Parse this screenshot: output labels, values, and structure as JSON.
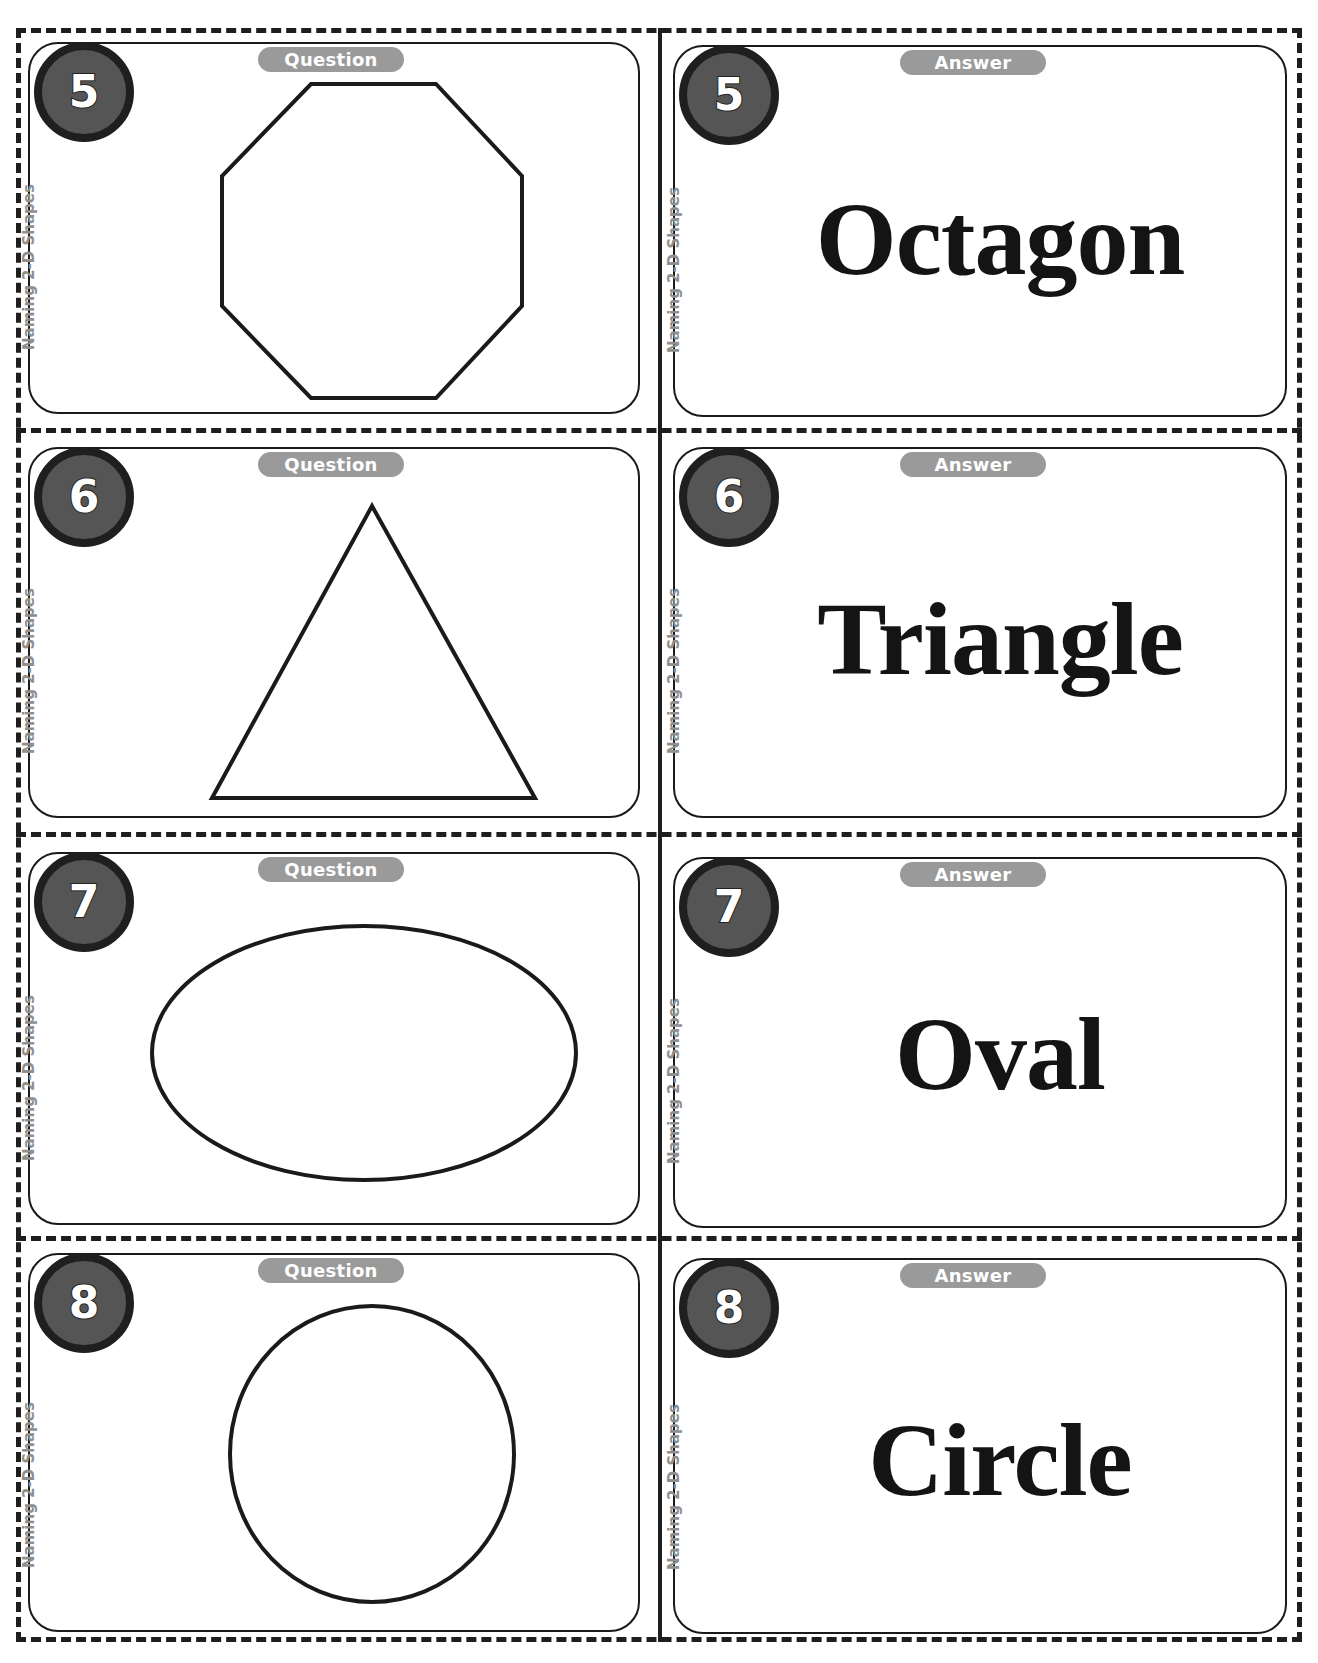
{
  "sheet": {
    "topic_label": "Naming 2-D Shapes",
    "question_label": "Question",
    "answer_label": "Answer"
  },
  "cards": [
    {
      "number": "5",
      "shape": "octagon",
      "answer": "Octagon"
    },
    {
      "number": "6",
      "shape": "triangle",
      "answer": "Triangle"
    },
    {
      "number": "7",
      "shape": "oval",
      "answer": "Oval"
    },
    {
      "number": "8",
      "shape": "circle",
      "answer": "Circle"
    }
  ],
  "colors": {
    "badge_fill": "#555555",
    "badge_border": "#1f1f1f",
    "pill_fill": "#9a9a9a",
    "side_label": "#8f8f8f",
    "outline": "#1a1a1a"
  }
}
